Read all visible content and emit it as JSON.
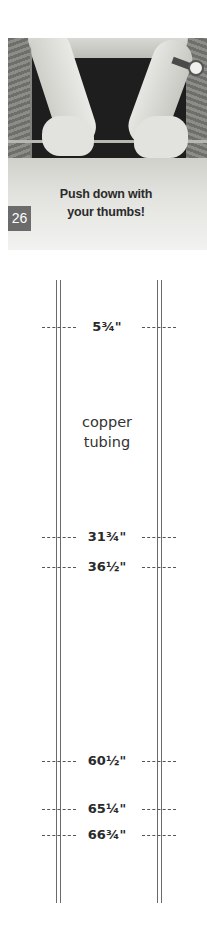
{
  "photo": {
    "description": "Hands pressing copper tubing down over a board edge",
    "caption_lines": [
      "Push down with",
      "your thumbs!"
    ],
    "step_number": "26",
    "badge_color": "#6b6b6b"
  },
  "diagram": {
    "part_label_lines": [
      "copper",
      "tubing"
    ],
    "rail_color": "#6a6a6a",
    "marks": [
      {
        "label": "5¾\"",
        "y": 327
      },
      {
        "label": "31¾\"",
        "y": 537
      },
      {
        "label": "36½\"",
        "y": 567
      },
      {
        "label": "60½\"",
        "y": 761
      },
      {
        "label": "65¼\"",
        "y": 809
      },
      {
        "label": "66¾\"",
        "y": 835
      }
    ]
  }
}
